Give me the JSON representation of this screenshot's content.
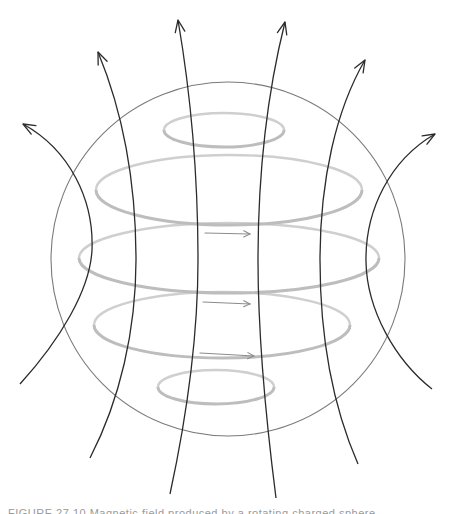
{
  "diagram": {
    "title": "",
    "canvas": {
      "width": 450,
      "height": 514,
      "background": "#ffffff"
    },
    "colors": {
      "sphere_outline": "#7a7a7a",
      "current_ring": "#cfcfcf",
      "field_line": "#2b2b2b",
      "current_arrow": "#8c8c8c"
    },
    "sphere": {
      "cx": 228,
      "cy": 259,
      "r": 177
    },
    "current_rings": [
      {
        "id": "ring-1",
        "cx": 224,
        "cy": 130,
        "rx": 60,
        "ry": 17
      },
      {
        "id": "ring-2",
        "cx": 229,
        "cy": 190,
        "rx": 133,
        "ry": 35
      },
      {
        "id": "ring-3",
        "cx": 229,
        "cy": 258,
        "rx": 150,
        "ry": 35
      },
      {
        "id": "ring-4",
        "cx": 222,
        "cy": 325,
        "rx": 128,
        "ry": 33
      },
      {
        "id": "ring-5",
        "cx": 216,
        "cy": 387,
        "rx": 58,
        "ry": 17
      }
    ],
    "current_arrows": [
      {
        "id": "current-arrow-1",
        "x1": 205,
        "y1": 233,
        "x2": 250,
        "y2": 234,
        "direction": "right"
      },
      {
        "id": "current-arrow-2",
        "x1": 203,
        "y1": 302,
        "x2": 250,
        "y2": 304,
        "direction": "right"
      },
      {
        "id": "current-arrow-3",
        "x1": 200,
        "y1": 353,
        "x2": 254,
        "y2": 356,
        "direction": "right"
      }
    ],
    "field_lines": [
      {
        "id": "field-line-1",
        "path": "M20,384 C60,340 90,290 92,250 C94,200 70,150 23,124",
        "tip": [
          23,
          124
        ],
        "direction": "up"
      },
      {
        "id": "field-line-2",
        "path": "M90,458 C120,400 136,330 136,260 C136,180 122,110 98,52",
        "tip": [
          98,
          52
        ],
        "direction": "up"
      },
      {
        "id": "field-line-3",
        "path": "M170,494 C186,420 198,340 198,260 C198,170 190,90 178,20",
        "tip": [
          178,
          20
        ],
        "direction": "up"
      },
      {
        "id": "field-line-4",
        "path": "M276,498 C266,420 258,340 258,260 C258,170 268,90 285,22",
        "tip": [
          285,
          22
        ],
        "direction": "up"
      },
      {
        "id": "field-line-5",
        "path": "M358,464 C330,400 320,330 320,260 C320,180 336,110 365,60",
        "tip": [
          365,
          60
        ],
        "direction": "up"
      },
      {
        "id": "field-line-6",
        "path": "M432,389 C395,360 367,310 366,262 C365,210 390,160 435,134",
        "tip": [
          435,
          134
        ],
        "direction": "up"
      }
    ],
    "caption_cut_off": "FIGURE 27.10 Magnetic field produced by a rotating charged sphere"
  }
}
